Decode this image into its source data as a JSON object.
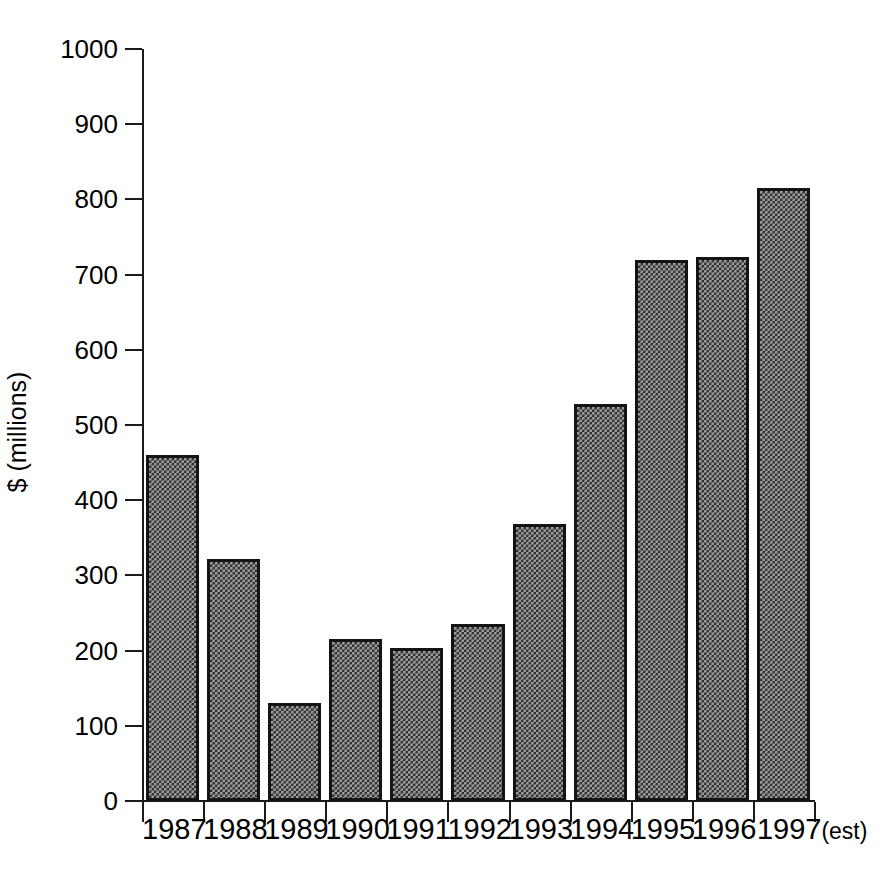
{
  "chart_data": {
    "type": "bar",
    "title": "",
    "subtitle": "",
    "xlabel": "",
    "ylabel": "$ (millions)",
    "categories": [
      "1987",
      "1988",
      "1989",
      "1990",
      "1991",
      "1992",
      "1993",
      "1994",
      "1995",
      "1996",
      "1997(est)"
    ],
    "values": [
      460,
      322,
      130,
      216,
      204,
      235,
      369,
      528,
      719,
      724,
      815
    ],
    "series": [
      {
        "name": "",
        "values": [
          460,
          322,
          130,
          216,
          204,
          235,
          369,
          528,
          719,
          724,
          815
        ]
      }
    ],
    "ylim": [
      0,
      1000
    ],
    "ytick_step": 100,
    "ytick_labels": [
      "0",
      "100",
      "200",
      "300",
      "400",
      "500",
      "600",
      "700",
      "800",
      "900",
      "1000"
    ],
    "grid": false,
    "legend": false,
    "legend_position": "none",
    "annotations": [],
    "bar_fill": "checkerboard-gray",
    "bar_edge_color": "#141414",
    "bar_face_color": "#9a9a9a",
    "axis_color": "#1a1a1a",
    "background_color": "#ffffff",
    "last_category_note": "(est)"
  },
  "axis": {
    "y_title": "$ (millions)",
    "y_ticks": [
      {
        "label": "1000",
        "value": 1000
      },
      {
        "label": "900",
        "value": 900
      },
      {
        "label": "800",
        "value": 800
      },
      {
        "label": "700",
        "value": 700
      },
      {
        "label": "600",
        "value": 600
      },
      {
        "label": "500",
        "value": 500
      },
      {
        "label": "400",
        "value": 400
      },
      {
        "label": "300",
        "value": 300
      },
      {
        "label": "200",
        "value": 200
      },
      {
        "label": "100",
        "value": 100
      },
      {
        "label": "0",
        "value": 0
      }
    ]
  },
  "x_axis": {
    "labels": [
      {
        "text": "1987",
        "suffix": ""
      },
      {
        "text": "1988",
        "suffix": ""
      },
      {
        "text": "1989",
        "suffix": ""
      },
      {
        "text": "1990",
        "suffix": ""
      },
      {
        "text": "1991",
        "suffix": ""
      },
      {
        "text": "1992",
        "suffix": ""
      },
      {
        "text": "1993",
        "suffix": ""
      },
      {
        "text": "1994",
        "suffix": ""
      },
      {
        "text": "1995",
        "suffix": ""
      },
      {
        "text": "1996",
        "suffix": ""
      },
      {
        "text": "1997",
        "suffix": "(est)"
      }
    ]
  }
}
